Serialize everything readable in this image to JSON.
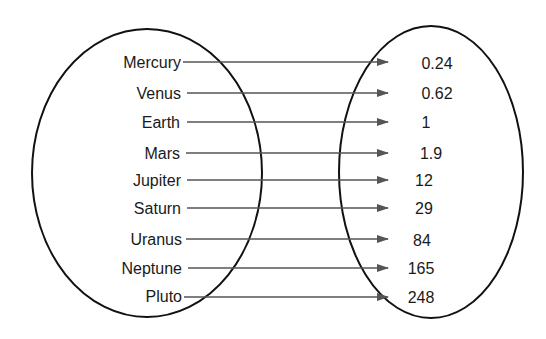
{
  "diagram": {
    "type": "mapping",
    "domain_set_label": "",
    "range_set_label": "",
    "rows": [
      {
        "planet": "Mercury",
        "value": "0.24"
      },
      {
        "planet": "Venus",
        "value": "0.62"
      },
      {
        "planet": "Earth",
        "value": "1"
      },
      {
        "planet": "Mars",
        "value": "1.9"
      },
      {
        "planet": "Jupiter",
        "value": "12"
      },
      {
        "planet": "Saturn",
        "value": "29"
      },
      {
        "planet": "Uranus",
        "value": "84"
      },
      {
        "planet": "Neptune",
        "value": "165"
      },
      {
        "planet": "Pluto",
        "value": "248"
      }
    ],
    "colors": {
      "ellipse": "#111111",
      "arrow": "#555555",
      "text": "#1a1a1a"
    }
  }
}
